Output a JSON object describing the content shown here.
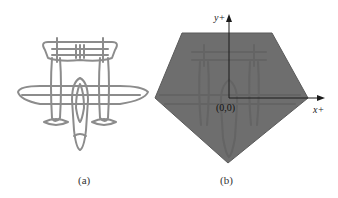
{
  "figure": {
    "panels": [
      {
        "id": "a",
        "caption": "(a)",
        "content": "line drawing of a twin-boom aircraft (top view)",
        "stroke_color": "#8a8a8a"
      },
      {
        "id": "b",
        "caption": "(b)",
        "content": "aircraft silhouette overlaid by a gray pentagon with coordinate axes",
        "fill_color": "#6e6e6e",
        "axes": {
          "x_label": "x+",
          "y_label": "y+",
          "origin_label": "(0,0)"
        }
      }
    ]
  }
}
